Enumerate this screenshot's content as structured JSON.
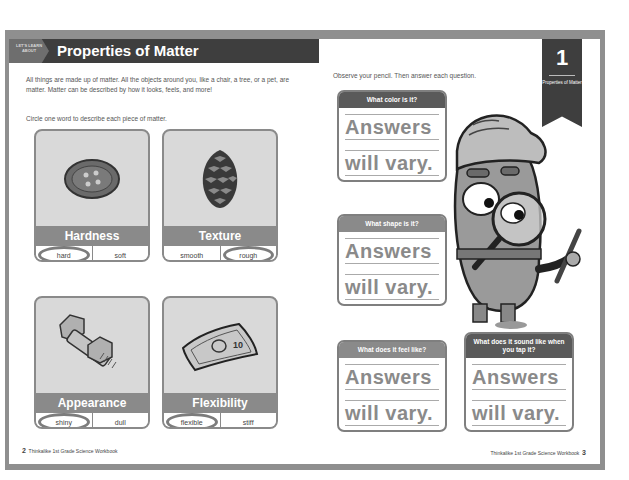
{
  "left_page": {
    "header": {
      "tag": "LET'S LEARN ABOUT",
      "title": "Properties of Matter"
    },
    "intro": "All things are made up of matter. All the objects around you, like a chair, a tree, or a pet, are matter. Matter can be described by how it looks, feels, and more!",
    "instruction": "Circle one word to describe each piece of matter.",
    "cards": [
      {
        "title": "Hardness",
        "image": "button-icon",
        "options": [
          "hard",
          "soft"
        ],
        "circled": 0
      },
      {
        "title": "Texture",
        "image": "pinecone-icon",
        "options": [
          "smooth",
          "rough"
        ],
        "circled": 1
      },
      {
        "title": "Appearance",
        "image": "bolt-icon",
        "options": [
          "shiny",
          "dull"
        ],
        "circled": 0
      },
      {
        "title": "Flexibility",
        "image": "dollar-bill-icon",
        "options": [
          "flexible",
          "stiff"
        ],
        "circled": 0
      }
    ],
    "footer": {
      "page_number": "2",
      "text": "Thinkalike 1st Grade Science Workbook"
    }
  },
  "right_page": {
    "ribbon": {
      "number": "1",
      "label": "Properties of Matter"
    },
    "instruction": "Observe your pencil. Then answer each question.",
    "questions": [
      {
        "question": "What color is it?",
        "answer_line1": "Answers",
        "answer_line2": "will vary."
      },
      {
        "question": "What shape is it?",
        "answer_line1": "Answers",
        "answer_line2": "will vary."
      },
      {
        "question": "What does it feel like?",
        "answer_line1": "Answers",
        "answer_line2": "will vary."
      },
      {
        "question": "What does it sound like when you tap it?",
        "answer_line1": "Answers",
        "answer_line2": "will vary."
      }
    ],
    "mascot": "explorer-with-magnifying-glass-icon",
    "footer": {
      "page_number": "3",
      "text": "Thinkalike 1st Grade Science Workbook"
    }
  },
  "colors": {
    "header_bg": "#3e3e3e",
    "card_bar": "#8a8a8a",
    "card_bg": "#d9d9d9",
    "answer_text": "#8a8a8a"
  }
}
